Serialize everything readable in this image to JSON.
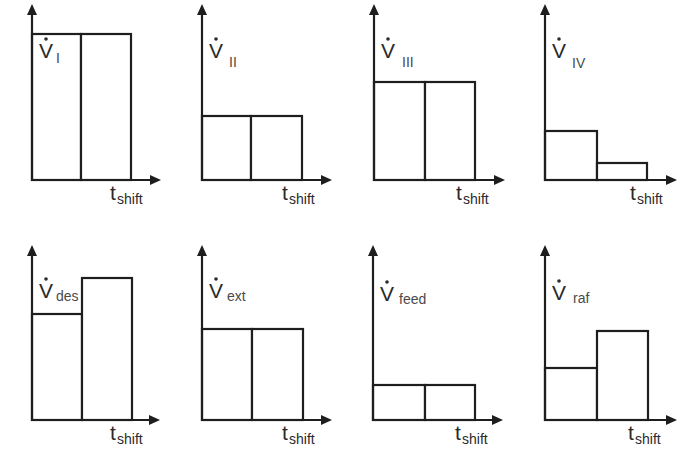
{
  "figure": {
    "width": 695,
    "height": 469,
    "line_color": "#1e1e1e",
    "text_color": "#2a2a2a",
    "x_axis_label": "t",
    "x_axis_label_sub": "shift",
    "y_symbol": "V",
    "y_symbol_accent": "dot"
  },
  "chart_data": [
    {
      "type": "bar",
      "title": "V̇ I",
      "ylabel": "V̇",
      "ylabel_sub": "I",
      "xlabel": "t_shift",
      "categories": [
        "shift 1",
        "shift 2"
      ],
      "values": [
        146,
        146
      ],
      "relative_values": [
        1.0,
        1.0
      ]
    },
    {
      "type": "bar",
      "title": "V̇ II",
      "ylabel": "V̇",
      "ylabel_sub": "II",
      "xlabel": "t_shift",
      "categories": [
        "shift 1",
        "shift 2"
      ],
      "values": [
        64,
        64
      ],
      "relative_values": [
        0.44,
        0.44
      ]
    },
    {
      "type": "bar",
      "title": "V̇ III",
      "ylabel": "V̇",
      "ylabel_sub": "III",
      "xlabel": "t_shift",
      "categories": [
        "shift 1",
        "shift 2"
      ],
      "values": [
        98,
        98
      ],
      "relative_values": [
        0.67,
        0.67
      ]
    },
    {
      "type": "bar",
      "title": "V̇ IV",
      "ylabel": "V̇",
      "ylabel_sub": "IV",
      "xlabel": "t_shift",
      "categories": [
        "shift 1",
        "shift 2"
      ],
      "values": [
        49,
        17
      ],
      "relative_values": [
        0.34,
        0.12
      ]
    },
    {
      "type": "bar",
      "title": "V̇ des",
      "ylabel": "V̇",
      "ylabel_sub": "des",
      "xlabel": "t_shift",
      "categories": [
        "shift 1",
        "shift 2"
      ],
      "values": [
        106,
        142
      ],
      "relative_values": [
        0.73,
        0.97
      ]
    },
    {
      "type": "bar",
      "title": "V̇ ext",
      "ylabel": "V̇",
      "ylabel_sub": "ext",
      "xlabel": "t_shift",
      "categories": [
        "shift 1",
        "shift 2"
      ],
      "values": [
        91,
        91
      ],
      "relative_values": [
        0.62,
        0.62
      ]
    },
    {
      "type": "bar",
      "title": "V̇ feed",
      "ylabel": "V̇",
      "ylabel_sub": "feed",
      "xlabel": "t_shift",
      "categories": [
        "shift 1",
        "shift 2"
      ],
      "values": [
        35,
        35
      ],
      "relative_values": [
        0.24,
        0.24
      ]
    },
    {
      "type": "bar",
      "title": "V̇ raf",
      "ylabel": "V̇",
      "ylabel_sub": "raf",
      "xlabel": "t_shift",
      "categories": [
        "shift 1",
        "shift 2"
      ],
      "values": [
        52,
        89
      ],
      "relative_values": [
        0.36,
        0.61
      ]
    }
  ],
  "panels": [
    {
      "id": "I",
      "sub": "I",
      "axis_x": 32,
      "baseline": 180,
      "axis_top": 4,
      "arrow_tip_x": 161,
      "bar_x": [
        32,
        81,
        131
      ],
      "bar_heights": [
        146,
        146
      ],
      "label_x": 39,
      "label_y": 58,
      "sub_x": 56,
      "sub_y": 63,
      "t_x": 110,
      "t_y": 200
    },
    {
      "id": "II",
      "sub": "II",
      "axis_x": 202,
      "baseline": 180,
      "axis_top": 4,
      "arrow_tip_x": 332,
      "bar_x": [
        202,
        251,
        302
      ],
      "bar_heights": [
        64,
        64
      ],
      "label_x": 209,
      "label_y": 58,
      "sub_x": 229,
      "sub_y": 67,
      "t_x": 282,
      "t_y": 200
    },
    {
      "id": "III",
      "sub": "III",
      "axis_x": 374,
      "baseline": 180,
      "axis_top": 4,
      "arrow_tip_x": 505,
      "bar_x": [
        374,
        425,
        475
      ],
      "bar_heights": [
        98,
        98
      ],
      "label_x": 381,
      "label_y": 58,
      "sub_x": 402,
      "sub_y": 67,
      "t_x": 456,
      "t_y": 200
    },
    {
      "id": "IV",
      "sub": "IV",
      "axis_x": 545,
      "baseline": 180,
      "axis_top": 4,
      "arrow_tip_x": 677,
      "bar_x": [
        545,
        597,
        647
      ],
      "bar_heights": [
        49,
        17
      ],
      "label_x": 552,
      "label_y": 58,
      "sub_x": 572,
      "sub_y": 68,
      "t_x": 630,
      "t_y": 200
    },
    {
      "id": "des",
      "sub": "des",
      "axis_x": 32,
      "baseline": 420,
      "axis_top": 245,
      "arrow_tip_x": 160,
      "bar_x": [
        32,
        82,
        132
      ],
      "bar_heights": [
        106,
        142
      ],
      "label_x": 39,
      "label_y": 298,
      "sub_x": 56,
      "sub_y": 301,
      "t_x": 110,
      "t_y": 440
    },
    {
      "id": "ext",
      "sub": "ext",
      "axis_x": 202,
      "baseline": 420,
      "axis_top": 245,
      "arrow_tip_x": 332,
      "bar_x": [
        202,
        252,
        303
      ],
      "bar_heights": [
        91,
        91
      ],
      "label_x": 209,
      "label_y": 298,
      "sub_x": 227,
      "sub_y": 301,
      "t_x": 282,
      "t_y": 440
    },
    {
      "id": "feed",
      "sub": "feed",
      "axis_x": 373,
      "baseline": 420,
      "axis_top": 245,
      "arrow_tip_x": 503,
      "bar_x": [
        373,
        425,
        475
      ],
      "bar_heights": [
        35,
        35
      ],
      "label_x": 380,
      "label_y": 301,
      "sub_x": 399,
      "sub_y": 304,
      "t_x": 455,
      "t_y": 440
    },
    {
      "id": "raf",
      "sub": "raf",
      "axis_x": 545,
      "baseline": 420,
      "axis_top": 245,
      "arrow_tip_x": 677,
      "bar_x": [
        545,
        597,
        648
      ],
      "bar_heights": [
        52,
        89
      ],
      "label_x": 552,
      "label_y": 300,
      "sub_x": 573,
      "sub_y": 303,
      "t_x": 628,
      "t_y": 440
    }
  ]
}
